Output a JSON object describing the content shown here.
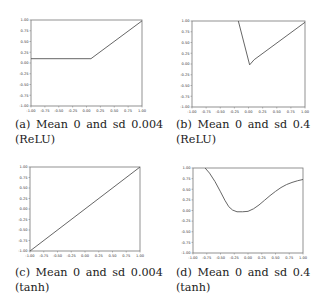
{
  "figure": {
    "panels": [
      {
        "id": "a",
        "caption_line1": "(a) Mean 0 and sd 0.004",
        "caption_line2": "(ReLU)",
        "frame": {
          "left": 31,
          "top": 20,
          "right": 142,
          "bottom": 106
        },
        "caption_pos": {
          "left": 15,
          "top": 117
        }
      },
      {
        "id": "b",
        "caption_line1": "(b) Mean 0 and sd 0.4",
        "caption_line2": "(ReLU)",
        "frame": {
          "left": 192,
          "top": 21,
          "right": 305,
          "bottom": 107
        },
        "caption_pos": {
          "left": 176,
          "top": 117
        }
      },
      {
        "id": "c",
        "caption_line1": "(c) Mean 0 and sd 0.004",
        "caption_line2": "(tanh)",
        "frame": {
          "left": 30,
          "top": 167,
          "right": 140,
          "bottom": 251
        },
        "caption_pos": {
          "left": 15,
          "top": 265
        }
      },
      {
        "id": "d",
        "caption_line1": "(d) Mean 0 and sd 0.4",
        "caption_line2": "(tanh)",
        "frame": {
          "left": 193,
          "top": 168,
          "right": 303,
          "bottom": 253
        },
        "caption_pos": {
          "left": 176,
          "top": 265
        }
      }
    ],
    "colors": {
      "line": "#555555",
      "frame": "#777777",
      "background": "#ffffff"
    }
  },
  "chart_data": [
    {
      "type": "line",
      "title": "(a) Mean 0 and sd 0.004 (ReLU)",
      "xlabel": "",
      "ylabel": "",
      "xlim": [
        -1.0,
        1.0
      ],
      "ylim": [
        -1.0,
        1.0
      ],
      "xticks": [
        "-1.00",
        "-0.75",
        "-0.50",
        "-0.25",
        "0.00",
        "0.25",
        "0.50",
        "0.75",
        "1.00"
      ],
      "yticks": [
        "-1.00",
        "-0.75",
        "-0.50",
        "-0.25",
        "0.00",
        "0.25",
        "0.50",
        "0.75",
        "1.00"
      ],
      "grid": false,
      "series": [
        {
          "name": "output",
          "x": [
            -1.0,
            0.08,
            1.0
          ],
          "y": [
            0.1,
            0.1,
            0.98
          ]
        }
      ]
    },
    {
      "type": "line",
      "title": "(b) Mean 0 and sd 0.4 (ReLU)",
      "xlabel": "",
      "ylabel": "",
      "xlim": [
        -1.0,
        1.0
      ],
      "ylim": [
        -1.0,
        1.0
      ],
      "xticks": [
        "-1.00",
        "-0.75",
        "-0.50",
        "-0.25",
        "0.00",
        "0.25",
        "0.50",
        "0.75",
        "1.00"
      ],
      "yticks": [
        "-1.00",
        "-0.75",
        "-0.50",
        "-0.25",
        "0.00",
        "0.25",
        "0.50",
        "0.75",
        "1.00"
      ],
      "grid": false,
      "series": [
        {
          "name": "output",
          "x": [
            -0.18,
            0.02,
            0.1,
            1.0
          ],
          "y": [
            1.0,
            -0.02,
            0.1,
            0.97
          ]
        }
      ]
    },
    {
      "type": "line",
      "title": "(c) Mean 0 and sd 0.004 (tanh)",
      "xlabel": "",
      "ylabel": "",
      "xlim": [
        -1.0,
        1.0
      ],
      "ylim": [
        -1.0,
        1.0
      ],
      "xticks": [
        "-1.00",
        "-0.75",
        "-0.50",
        "-0.25",
        "0.00",
        "0.25",
        "0.50",
        "0.75",
        "1.00"
      ],
      "yticks": [
        "-1.00",
        "-0.75",
        "-0.50",
        "-0.25",
        "0.00",
        "0.25",
        "0.50",
        "0.75",
        "1.00"
      ],
      "grid": false,
      "series": [
        {
          "name": "output",
          "x": [
            -1.0,
            1.0
          ],
          "y": [
            -1.0,
            1.0
          ]
        }
      ]
    },
    {
      "type": "line",
      "title": "(d) Mean 0 and sd 0.4 (tanh)",
      "xlabel": "",
      "ylabel": "",
      "xlim": [
        -1.0,
        1.0
      ],
      "ylim": [
        -1.0,
        1.0
      ],
      "xticks": [
        "-1.00",
        "-0.75",
        "-0.50",
        "-0.25",
        "0.00",
        "0.25",
        "0.50",
        "0.75",
        "1.00"
      ],
      "yticks": [
        "-1.00",
        "-0.75",
        "-0.50",
        "-0.25",
        "0.00",
        "0.25",
        "0.50",
        "0.75",
        "1.00"
      ],
      "grid": false,
      "series": [
        {
          "name": "output",
          "x": [
            -0.78,
            -0.7,
            -0.6,
            -0.5,
            -0.42,
            -0.35,
            -0.28,
            -0.2,
            -0.1,
            0.0,
            0.1,
            0.2,
            0.3,
            0.4,
            0.5,
            0.6,
            0.7,
            0.8,
            0.9,
            1.0
          ],
          "y": [
            1.0,
            0.88,
            0.68,
            0.44,
            0.24,
            0.09,
            0.01,
            -0.03,
            -0.03,
            -0.02,
            0.04,
            0.13,
            0.24,
            0.35,
            0.45,
            0.54,
            0.61,
            0.66,
            0.7,
            0.73
          ]
        }
      ]
    }
  ]
}
